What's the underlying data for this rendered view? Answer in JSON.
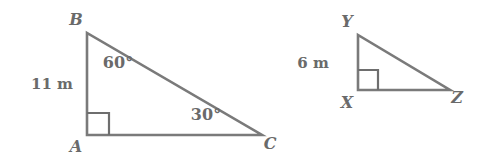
{
  "figure": {
    "type": "geometry-diagram",
    "background_color": "#ffffff",
    "stroke_color": "#7a7a7a",
    "label_color": "#6a6a6a"
  },
  "triangles": [
    {
      "id": "ABC",
      "name": "left-triangle",
      "vertices": [
        {
          "label": "B",
          "x": 87,
          "y": 33,
          "label_x": 76,
          "label_y": 25
        },
        {
          "label": "A",
          "x": 87,
          "y": 135,
          "label_x": 76,
          "label_y": 152
        },
        {
          "label": "C",
          "x": 262,
          "y": 135,
          "label_x": 270,
          "label_y": 149
        }
      ],
      "right_angle_at": "A",
      "right_angle_marker": {
        "x": 87,
        "y": 135,
        "size": 22,
        "dir_x": 1,
        "dir_y": -1
      },
      "side_labels": [
        {
          "text": "11 m",
          "side": "AB",
          "x": 52,
          "y": 89
        }
      ],
      "angle_labels": [
        {
          "text": "60°",
          "vertex": "B",
          "x": 118,
          "y": 68
        },
        {
          "text": "30°",
          "vertex": "C",
          "x": 206,
          "y": 120
        }
      ]
    },
    {
      "id": "XYZ",
      "name": "right-triangle",
      "vertices": [
        {
          "label": "Y",
          "x": 358,
          "y": 35,
          "label_x": 347,
          "label_y": 27
        },
        {
          "label": "X",
          "x": 358,
          "y": 90,
          "label_x": 347,
          "label_y": 108
        },
        {
          "label": "Z",
          "x": 450,
          "y": 90,
          "label_x": 457,
          "label_y": 103
        }
      ],
      "right_angle_at": "X",
      "right_angle_marker": {
        "x": 358,
        "y": 90,
        "size": 20,
        "dir_x": 1,
        "dir_y": -1
      },
      "side_labels": [
        {
          "text": "6 m",
          "side": "XY",
          "x": 313,
          "y": 68
        }
      ],
      "angle_labels": []
    }
  ]
}
